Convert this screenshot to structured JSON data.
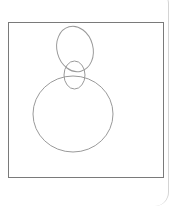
{
  "diagram": {
    "colors": {
      "frame": "#7a7a7a",
      "shape_stroke": "#9a9a9a",
      "panel_border": "#d4d4d4",
      "background": "#ffffff"
    },
    "frame": {
      "x": 8.5,
      "y": 22.5,
      "width": 155,
      "height": 155
    },
    "shapes": [
      {
        "id": "top-ellipse",
        "type": "ellipse",
        "cx": 75,
        "cy": 49,
        "rx": 18,
        "ry": 23,
        "rotate": -15
      },
      {
        "id": "small-ellipse",
        "type": "ellipse",
        "cx": 74.5,
        "cy": 75,
        "rx": 10.5,
        "ry": 14,
        "rotate": 0
      },
      {
        "id": "large-circle",
        "type": "ellipse",
        "cx": 73,
        "cy": 114,
        "rx": 40,
        "ry": 38,
        "rotate": 0
      }
    ]
  }
}
